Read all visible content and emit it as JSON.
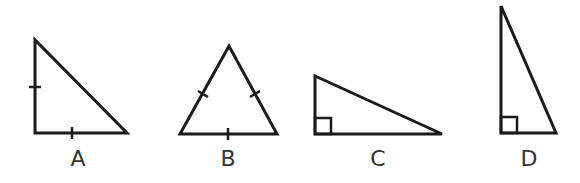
{
  "figure": {
    "stroke_color": "#1a1a1a",
    "label_color": "#333333",
    "triangles": [
      {
        "label": "A",
        "type": "isosceles right triangle",
        "marks": "two equal-side tick marks (left leg and base)",
        "x": 78
      },
      {
        "label": "B",
        "type": "equilateral triangle",
        "marks": "three equal-side tick marks",
        "x": 228
      },
      {
        "label": "C",
        "type": "right triangle (wide)",
        "marks": "right-angle box",
        "x": 378
      },
      {
        "label": "D",
        "type": "right triangle (tall)",
        "marks": "right-angle box",
        "x": 529
      }
    ]
  }
}
